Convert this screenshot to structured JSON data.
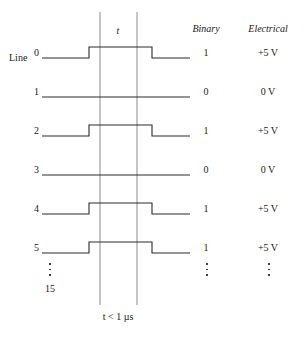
{
  "diagram": {
    "row_label_prefix": "Line",
    "time_label": "t",
    "duration_label": "t < 1 µs",
    "ellipsis_label": "15",
    "columns": {
      "binary_header": "Binary",
      "electrical_header": "Electrical"
    },
    "colors": {
      "waveform": "#2b2b2b",
      "guide_line": "#8a8a8a",
      "text": "#1a1a1a",
      "background": "#ffffff"
    },
    "guides": {
      "left_x": 100,
      "right_x": 137,
      "top_y": 12,
      "bottom_y": 305
    },
    "rows": [
      {
        "line": "0",
        "binary": "1",
        "electrical": "+5 V",
        "pulse": true,
        "y": 58
      },
      {
        "line": "1",
        "binary": "0",
        "electrical": "0 V",
        "pulse": false,
        "y": 97
      },
      {
        "line": "2",
        "binary": "1",
        "electrical": "+5 V",
        "pulse": true,
        "y": 136
      },
      {
        "line": "3",
        "binary": "0",
        "electrical": "0 V",
        "pulse": false,
        "y": 175
      },
      {
        "line": "4",
        "binary": "1",
        "electrical": "+5 V",
        "pulse": true,
        "y": 214
      },
      {
        "line": "5",
        "binary": "1",
        "electrical": "+5 V",
        "pulse": true,
        "y": 253
      }
    ],
    "waveform_geometry": {
      "start_x": 42,
      "rise_x": 89,
      "fall_x": 152,
      "end_x": 190,
      "pulse_height": 11
    }
  }
}
